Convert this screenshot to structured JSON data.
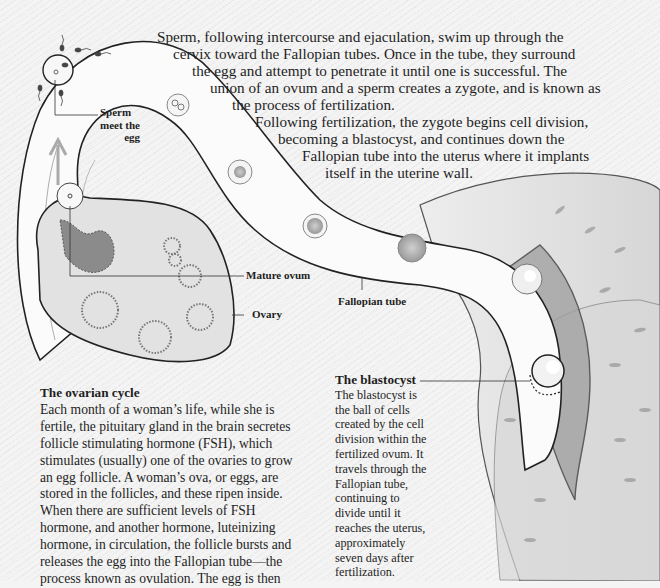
{
  "intro": {
    "lines": [
      "Sperm, following intercourse and ejaculation, swim up through the",
      "cervix toward the Fallopian tubes.  Once in the tube, they surround",
      "the egg and attempt to penetrate it until one is successful.  The",
      "union of an ovum and a sperm creates a zygote, and is known as",
      "the process of fertilization.",
      "Following fertilization, the zygote begins cell division,",
      "becoming a blastocyst, and continues down the",
      "Fallopian tube into the uterus where it implants",
      "itself in the uterine wall."
    ]
  },
  "labels": {
    "sperm_meet_egg": [
      "Sperm",
      "meet the",
      "egg"
    ],
    "mature_ovum": "Mature ovum",
    "ovary": "Ovary",
    "fallopian_tube": "Fallopian tube"
  },
  "ovarian_cycle": {
    "title": "The ovarian cycle",
    "lines": [
      "Each month of a woman’s life, while she is",
      "fertile, the pituitary gland in the brain secretes",
      "follicle stimulating hormone (FSH), which",
      "stimulates (usually) one of the ovaries to grow",
      "an egg follicle. A woman’s ova, or eggs, are",
      "stored in the follicles, and these ripen inside.",
      "When there are sufficient levels of FSH",
      "hormone, and another hormone, luteinizing",
      "hormone, in circulation, the follicle bursts and",
      "releases the egg into the Fallopian tube—the",
      "process known as ovulation.  The egg is then"
    ]
  },
  "blastocyst": {
    "title": "The blastocyst",
    "lines": [
      "The blastocyst is",
      "the ball of cells",
      "created by the cell",
      "division within the",
      "fertilized ovum.  It",
      "travels through the",
      "Fallopian tube,",
      "continuing to",
      "divide until it",
      "reaches the uterus,",
      "approximately",
      "seven days after",
      "fertilization."
    ]
  },
  "colors": {
    "background": "#f4f4f4",
    "ink": "#1e1e1e",
    "tube_fill": "#fbfbfb",
    "ovary_fill": "#e2e2e2",
    "uterus_fill": "#e6e6e6"
  }
}
